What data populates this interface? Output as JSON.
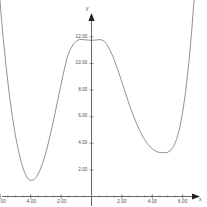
{
  "chart_data": {
    "type": "line",
    "title": "",
    "subtitle": "",
    "xlabel": "x",
    "ylabel": "y",
    "xlim": [
      -6.6,
      7.0
    ],
    "ylim": [
      0.0,
      13.2
    ],
    "grid": false,
    "legend": null,
    "axis_style": "arrow-axes",
    "curve_color": "#6e6e6e",
    "axis_color": "#222222",
    "background_color": "#ffffff",
    "x_ticks": [
      {
        "value": -6,
        "label": "-6.00"
      },
      {
        "value": -4,
        "label": "-4.00"
      },
      {
        "value": -2,
        "label": "-2.00"
      },
      {
        "value": 2,
        "label": "2.00"
      },
      {
        "value": 4,
        "label": "4.00"
      },
      {
        "value": 6,
        "label": "6.00"
      }
    ],
    "y_ticks": [
      {
        "value": 2,
        "label": "2.00"
      },
      {
        "value": 4,
        "label": "4.00"
      },
      {
        "value": 6,
        "label": "6.00"
      },
      {
        "value": 8,
        "label": "8.00"
      },
      {
        "value": 10,
        "label": "10.00"
      },
      {
        "value": 12,
        "label": "12.00"
      }
    ],
    "x_minor_tick_step": 0.5,
    "series": [
      {
        "name": "curve",
        "description": "quartic W-shaped curve with two minima and one local maximum",
        "key_points": [
          {
            "role": "left-minimum",
            "x": -4.0,
            "y": 1.2
          },
          {
            "role": "local-maximum",
            "x": 0.55,
            "y": 11.8
          },
          {
            "role": "right-minimum",
            "x": 5.0,
            "y": 3.3
          }
        ],
        "x": [
          -6.6,
          -6.4,
          -6.2,
          -6.0,
          -5.8,
          -5.6,
          -5.4,
          -5.2,
          -5.0,
          -4.8,
          -4.6,
          -4.4,
          -4.2,
          -4.0,
          -3.8,
          -3.6,
          -3.4,
          -3.2,
          -3.0,
          -2.8,
          -2.6,
          -2.4,
          -2.2,
          -2.0,
          -1.8,
          -1.6,
          -1.4,
          -1.2,
          -1.0,
          -0.8,
          -0.6,
          -0.4,
          -0.2,
          0.0,
          0.2,
          0.4,
          0.6,
          0.8,
          1.0,
          1.2,
          1.4,
          1.6,
          1.8,
          2.0,
          2.2,
          2.4,
          2.6,
          2.8,
          3.0,
          3.2,
          3.4,
          3.6,
          3.8,
          4.0,
          4.2,
          4.4,
          4.6,
          4.8,
          5.0,
          5.2,
          5.4,
          5.6,
          5.8,
          6.0,
          6.2,
          6.4,
          6.6,
          6.8,
          7.0
        ],
        "y": [
          24.2,
          20.6,
          17.3,
          14.4,
          11.8,
          9.6,
          7.6,
          5.95,
          4.55,
          3.4,
          2.5,
          1.8,
          1.35,
          1.2,
          1.25,
          1.5,
          1.95,
          2.55,
          3.3,
          4.2,
          5.2,
          6.25,
          7.35,
          8.45,
          9.5,
          10.45,
          11.05,
          11.45,
          11.7,
          11.8,
          11.8,
          11.78,
          11.76,
          11.74,
          11.76,
          11.78,
          11.8,
          11.7,
          11.45,
          11.05,
          10.55,
          9.95,
          9.3,
          8.6,
          7.9,
          7.2,
          6.55,
          5.95,
          5.4,
          4.9,
          4.45,
          4.1,
          3.8,
          3.58,
          3.42,
          3.33,
          3.3,
          3.3,
          3.32,
          3.45,
          3.75,
          4.3,
          5.15,
          6.35,
          7.95,
          10.0,
          12.55,
          15.6,
          19.2
        ]
      }
    ]
  },
  "axes": {
    "y_axis_name": "y",
    "x_axis_name": "x"
  }
}
